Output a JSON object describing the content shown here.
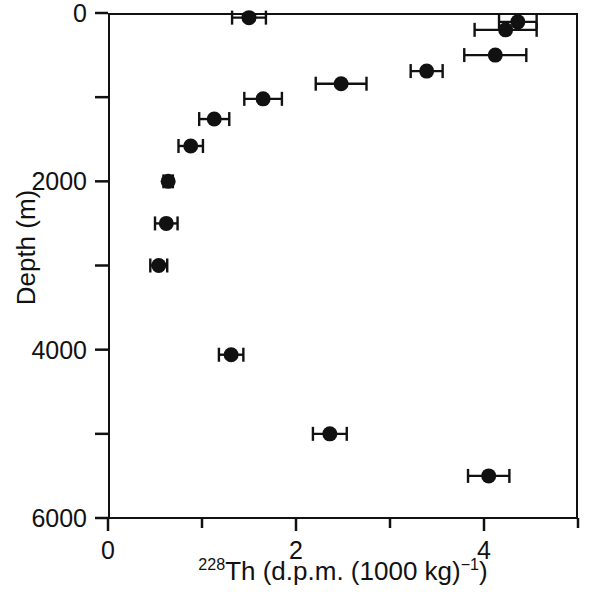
{
  "chart_data": {
    "type": "scatter",
    "title": "",
    "xlabel": "228Th (d.p.m. (1000 kg)-1)",
    "xlabel_parts": {
      "superscript_isotope": "228",
      "element": "Th",
      "unit_open": " (d.p.m. (1000 kg)",
      "exponent": "−1",
      "unit_close": ")"
    },
    "ylabel": "Depth (m)",
    "xlim": [
      0,
      5
    ],
    "ylim": [
      6000,
      0
    ],
    "y_inverted": true,
    "grid": false,
    "legend": null,
    "x_ticks_major": [
      0,
      2,
      4
    ],
    "x_ticks_minor": [
      1,
      3,
      5
    ],
    "x_tick_labels": [
      "0",
      "2",
      "4"
    ],
    "y_ticks_major": [
      0,
      2000,
      4000,
      6000
    ],
    "y_ticks_minor": [
      1000,
      3000,
      5000
    ],
    "y_tick_labels": [
      "0",
      "2000",
      "4000",
      "6000"
    ],
    "marker": "filled-circle",
    "marker_color": "#111111",
    "error_bar_orientation": "horizontal",
    "points": [
      {
        "x": 1.5,
        "y": 55,
        "xerr": 0.18
      },
      {
        "x": 4.36,
        "y": 105,
        "xerr": 0.2
      },
      {
        "x": 4.23,
        "y": 200,
        "xerr": 0.33
      },
      {
        "x": 4.12,
        "y": 500,
        "xerr": 0.33
      },
      {
        "x": 3.39,
        "y": 690,
        "xerr": 0.17
      },
      {
        "x": 2.48,
        "y": 840,
        "xerr": 0.27
      },
      {
        "x": 1.65,
        "y": 1020,
        "xerr": 0.2
      },
      {
        "x": 1.13,
        "y": 1260,
        "xerr": 0.16
      },
      {
        "x": 0.88,
        "y": 1580,
        "xerr": 0.13
      },
      {
        "x": 0.64,
        "y": 2000,
        "xerr": 0.05
      },
      {
        "x": 0.62,
        "y": 2500,
        "xerr": 0.12
      },
      {
        "x": 0.54,
        "y": 3000,
        "xerr": 0.09
      },
      {
        "x": 1.31,
        "y": 4060,
        "xerr": 0.13
      },
      {
        "x": 2.36,
        "y": 5000,
        "xerr": 0.18
      },
      {
        "x": 4.05,
        "y": 5500,
        "xerr": 0.22
      }
    ]
  },
  "axes": {
    "y_title": "Depth (m)",
    "y_tick_labels": [
      "0",
      "2000",
      "4000",
      "6000"
    ],
    "x_tick_labels": [
      "0",
      "2",
      "4"
    ]
  },
  "colors": {
    "axis": "#111111",
    "marker": "#111111",
    "background": "#ffffff"
  }
}
